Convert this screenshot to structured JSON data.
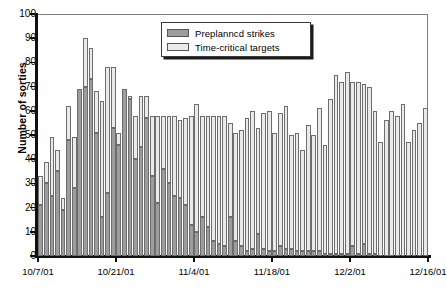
{
  "chart_data": {
    "type": "bar",
    "barmode": "stacked",
    "title": "",
    "xlabel": "",
    "ylabel": "Number of sorties",
    "ylim": [
      0,
      100
    ],
    "ytick_step": 10,
    "yticks": [
      0,
      10,
      20,
      30,
      40,
      50,
      60,
      70,
      80,
      90,
      100
    ],
    "grid": false,
    "legend_position": "top-center",
    "xtick_labels": [
      "10/7/01",
      "10/21/01",
      "11/4/01",
      "11/18/01",
      "12/2/01",
      "12/16/01"
    ],
    "xtick_days": [
      0,
      14,
      28,
      42,
      56,
      70
    ],
    "x_start_date": "10/7/01",
    "x_interval_days": 1,
    "n_bars": 70,
    "series": [
      {
        "name": "Preplanned strikes",
        "color": "#9d9d9d",
        "values": [
          21,
          30,
          25,
          35,
          19,
          48,
          28,
          69,
          70,
          73,
          51,
          16,
          26,
          53,
          46,
          69,
          65,
          40,
          45,
          57,
          33,
          22,
          36,
          30,
          25,
          24,
          21,
          13,
          10,
          16,
          12,
          6,
          5,
          4,
          16,
          6,
          4,
          2,
          3,
          9,
          3,
          2,
          2,
          4,
          3,
          3,
          2,
          2,
          2,
          2,
          2,
          1,
          1,
          1,
          1,
          1,
          4,
          1,
          5,
          1,
          1,
          0,
          0,
          0,
          0,
          0,
          0,
          0,
          0,
          0
        ]
      },
      {
        "name": "Time-critical targets",
        "color": "#eaeaea",
        "values": [
          12,
          9,
          24,
          9,
          5,
          14,
          21,
          0,
          20,
          13,
          17,
          48,
          52,
          25,
          5,
          0,
          1,
          18,
          21,
          9,
          25,
          36,
          22,
          28,
          33,
          32,
          36,
          45,
          53,
          42,
          46,
          52,
          53,
          54,
          39,
          45,
          48,
          55,
          57,
          44,
          56,
          58,
          49,
          55,
          59,
          47,
          49,
          42,
          52,
          48,
          59,
          45,
          64,
          74,
          71,
          75,
          68,
          71,
          66,
          69,
          59,
          47,
          56,
          60,
          58,
          63,
          47,
          52,
          55,
          61
        ]
      }
    ]
  },
  "legend": {
    "items": [
      {
        "label": "Preplannсd strikes",
        "swatch": "preplanned-swatch"
      },
      {
        "label": "Time-critical targets",
        "swatch": "time-critical-swatch"
      }
    ]
  },
  "axes": {
    "y_title": "Number of sorties"
  }
}
